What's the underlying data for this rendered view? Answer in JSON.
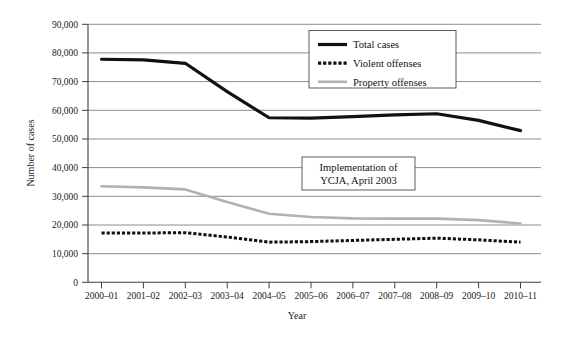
{
  "chart_data": {
    "type": "line",
    "title": "",
    "xlabel": "Year",
    "ylabel": "Number of cases",
    "categories": [
      "2000–01",
      "2001–02",
      "2002–03",
      "2003–04",
      "2004–05",
      "2005–06",
      "2006–07",
      "2007–08",
      "2008–09",
      "2009–10",
      "2010–11"
    ],
    "ylim": [
      0,
      90000
    ],
    "ytick_labels": [
      "90,000",
      "80,000",
      "70,000",
      "60,000",
      "50,000",
      "40,000",
      "30,000",
      "20,000",
      "10,000",
      "0"
    ],
    "ytick_values": [
      90000,
      80000,
      70000,
      60000,
      50000,
      40000,
      30000,
      20000,
      10000,
      0
    ],
    "grid": "horizontal",
    "legend_position": "top-center-right",
    "series": [
      {
        "name": "Total cases",
        "style": "solid-thick-black",
        "color": "#111111",
        "values": [
          77800,
          77600,
          76400,
          66500,
          57400,
          57300,
          57800,
          58400,
          58800,
          56500,
          52900
        ]
      },
      {
        "name": "Violent offenses",
        "style": "dashed-thick-black",
        "color": "#111111",
        "values": [
          17200,
          17200,
          17300,
          15800,
          14000,
          14200,
          14600,
          15000,
          15400,
          14800,
          14000
        ]
      },
      {
        "name": "Property offenses",
        "style": "solid-gray",
        "color": "#b0b2b5",
        "values": [
          33500,
          33100,
          32400,
          28000,
          23900,
          22800,
          22300,
          22200,
          22200,
          21700,
          20500
        ]
      }
    ],
    "annotations": [
      {
        "name": "ycja-implementation-note",
        "line1": "Implementation of",
        "line2": "YCJA, April 2003"
      }
    ]
  }
}
